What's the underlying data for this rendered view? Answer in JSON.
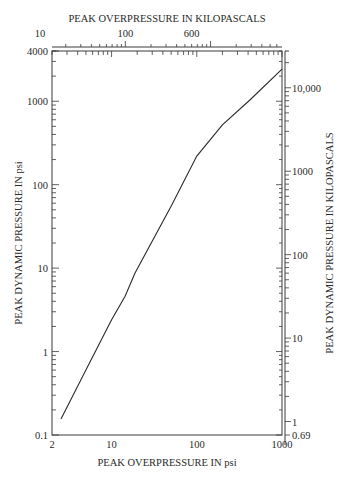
{
  "chart_data": {
    "type": "line",
    "title": "",
    "xlabel": "PEAK OVERPRESSURE IN psi",
    "ylabel": "PEAK DYNAMIC PRESSURE IN psi",
    "x2label": "PEAK OVERPRESSURE IN KILOPASCALS",
    "y2label": "PEAK DYNAMIC PRESSURE IN KILOPASCALS",
    "xscale": "log",
    "yscale": "log",
    "xlim": [
      2,
      1000
    ],
    "ylim": [
      0.1,
      4000
    ],
    "x2lim": [
      13.8,
      6900
    ],
    "y2lim": [
      0.69,
      27600
    ],
    "x_ticks": [
      "2",
      "10",
      "100",
      "1000"
    ],
    "y_ticks": [
      "0.1",
      "1",
      "10",
      "100",
      "1000",
      "4000"
    ],
    "x2_ticks": [
      "2",
      "10",
      "100",
      "600"
    ],
    "y2_ticks": [
      "0.69",
      "1",
      "10",
      "100",
      "1000",
      "10,000"
    ],
    "grid": false,
    "legend": null,
    "series": [
      {
        "name": "Peak dynamic pressure vs peak overpressure",
        "x": [
          2.55,
          5,
          10,
          14.4,
          18.8,
          50,
          100,
          200,
          420,
          1000
        ],
        "y": [
          0.155,
          0.6,
          2.4,
          4.6,
          8.7,
          55,
          220,
          520,
          1035,
          2430
        ]
      }
    ]
  }
}
